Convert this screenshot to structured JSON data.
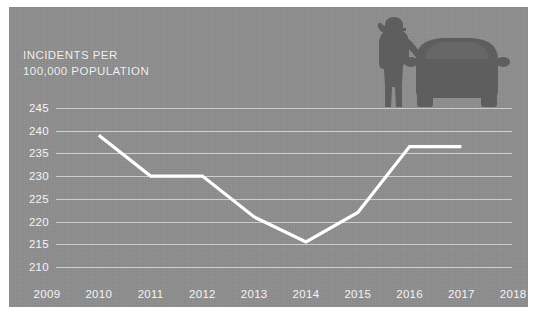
{
  "chart_data": {
    "type": "line",
    "title_line1": "INCIDENTS PER",
    "title_line2": "100,000 POPULATION",
    "xlabel": "",
    "ylabel": "INCIDENTS PER 100,000 POPULATION",
    "categories": [
      "2009",
      "2010",
      "2011",
      "2012",
      "2013",
      "2014",
      "2015",
      "2016",
      "2017",
      "2018"
    ],
    "x": [
      2009,
      2010,
      2011,
      2012,
      2013,
      2014,
      2015,
      2016,
      2017,
      2018
    ],
    "series": [
      {
        "name": "Incidents per 100,000 population",
        "x": [
          2010,
          2011,
          2012,
          2013,
          2014,
          2015,
          2016,
          2017
        ],
        "values": [
          239,
          230,
          230,
          221,
          215.5,
          222,
          236.5,
          236.5
        ],
        "color": "#ffffff"
      }
    ],
    "yticks": [
      245,
      240,
      235,
      230,
      225,
      220,
      215,
      210
    ],
    "ytick_labels": [
      "245",
      "240",
      "235",
      "230",
      "225",
      "220",
      "215",
      "210"
    ],
    "ylim": [
      210,
      245
    ],
    "xlim": [
      2009,
      2018
    ],
    "grid": true,
    "legend": false,
    "legend_position": "none",
    "background_color": "#8e8e8e",
    "gridline_color": "#d8d8d8",
    "text_color": "#f4f4f4",
    "line_color": "#ffffff"
  },
  "illustration": {
    "description": "silhouette of a person on a phone standing beside a car",
    "person_label": "person-silhouette",
    "car_label": "car-silhouette",
    "color": "#5e5e5e"
  },
  "footnote": {
    "text": ""
  }
}
